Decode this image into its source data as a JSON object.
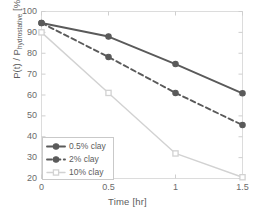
{
  "chart_data": {
    "type": "line",
    "title": "",
    "xlabel": "Time [hr]",
    "ylabel_main": "P(t) / P",
    "ylabel_sub": "hydrostative",
    "ylabel_unit": " [%]",
    "xlim": [
      0,
      1.5
    ],
    "ylim": [
      20,
      100
    ],
    "xticks": [
      "0",
      "0.5",
      "1",
      "1.5"
    ],
    "xtick_values": [
      0,
      0.5,
      1,
      1.5
    ],
    "yticks": [
      "100",
      "90",
      "80",
      "70",
      "60",
      "50",
      "40",
      "30",
      "20"
    ],
    "ytick_values": [
      100,
      90,
      80,
      70,
      60,
      50,
      40,
      30,
      20
    ],
    "grid": false,
    "legend_position": "lower-left",
    "x": [
      0,
      0.5,
      1,
      1.5
    ],
    "series": [
      {
        "name": "0.5% clay",
        "values": [
          94.5,
          88.0,
          74.8,
          60.8
        ],
        "color": "#5a5a5a",
        "linestyle": "solid",
        "marker": "circle"
      },
      {
        "name": "2% clay",
        "values": [
          94.5,
          78.2,
          61.0,
          45.6
        ],
        "color": "#5a5a5a",
        "linestyle": "dashed",
        "marker": "circle"
      },
      {
        "name": "10% clay",
        "values": [
          90.0,
          61.0,
          32.0,
          20.6
        ],
        "color": "#d2d2d2",
        "linestyle": "solid",
        "marker": "square"
      }
    ]
  },
  "axes": {
    "frame_color": "#d9d9d9",
    "tick_color": "#6b6b6b"
  },
  "legend": {
    "entries": [
      {
        "label": "0.5% clay"
      },
      {
        "label": "2% clay"
      },
      {
        "label": "10% clay"
      }
    ]
  }
}
